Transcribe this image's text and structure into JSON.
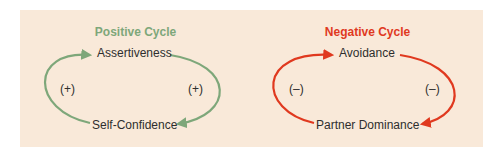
{
  "colors": {
    "panel_bg": "#f9e9d9",
    "positive": "#7ea77a",
    "negative": "#e0391f",
    "text": "#2e2e2e"
  },
  "positive_cycle": {
    "title": "Positive Cycle",
    "top_node": "Assertiveness",
    "bottom_node": "Self-Confidence",
    "left_sign": "(+)",
    "right_sign": "(+)"
  },
  "negative_cycle": {
    "title": "Negative Cycle",
    "top_node": "Avoidance",
    "bottom_node": "Partner Dominance",
    "left_sign": "(–)",
    "right_sign": "(–)"
  }
}
